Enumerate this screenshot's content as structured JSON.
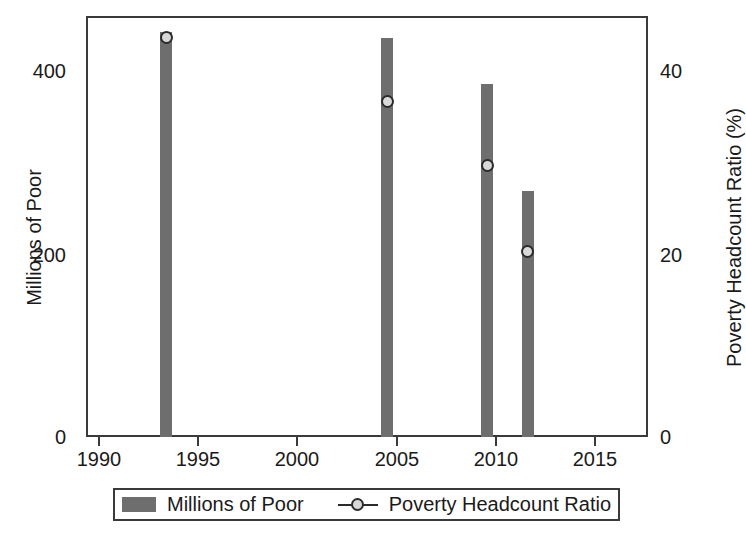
{
  "chart_data": {
    "type": "bar",
    "title": "",
    "subtitle": "",
    "xlabel": "",
    "ylabel": "Millions of Poor",
    "y2label": "Poverty Headcount Ratio (%)",
    "x": [
      1993,
      2004,
      2009,
      2011
    ],
    "xlim": [
      1989,
      2017
    ],
    "ylim": [
      0,
      460
    ],
    "y2lim": [
      0,
      46
    ],
    "grid": false,
    "legend_position": "bottom",
    "xticks": [
      1990,
      1995,
      2000,
      2005,
      2010,
      2015
    ],
    "xtick_labels": [
      "1990",
      "1995",
      "2000",
      "2005",
      "2010",
      "2015"
    ],
    "yticks": [
      0,
      200,
      400
    ],
    "ytick_labels": [
      "0",
      "200",
      "400"
    ],
    "y2ticks": [
      0,
      20,
      40
    ],
    "y2tick_labels": [
      "0",
      "20",
      "40"
    ],
    "series": [
      {
        "name": "Millions of Poor",
        "kind": "bar",
        "axis": "left",
        "color": "#6e6e6e",
        "values": [
          443,
          436,
          386,
          269
        ]
      },
      {
        "name": "Poverty Headcount Ratio",
        "kind": "line-marker",
        "axis": "right",
        "color": "#2b2b2b",
        "marker_fill": "#d8d8d8",
        "values": [
          43.7,
          36.7,
          29.7,
          20.3
        ]
      }
    ]
  },
  "legend": {
    "entries": [
      {
        "label": "Millions of Poor",
        "icon": "bar-swatch"
      },
      {
        "label": "Poverty Headcount Ratio",
        "icon": "line-marker-swatch"
      }
    ]
  },
  "colors": {
    "bar": "#6e6e6e",
    "marker_edge": "#2b2b2b",
    "marker_face": "#d8d8d8",
    "axis": "#3a3a3a",
    "text": "#1a1a1a",
    "background": "#ffffff"
  }
}
